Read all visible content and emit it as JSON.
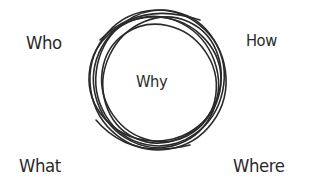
{
  "diagram": {
    "type": "five-w-one-h",
    "center": {
      "label": "Why",
      "shape": "scribbled-circle"
    },
    "corners": {
      "top_left": "Who",
      "top_right": "How",
      "bottom_left": "What",
      "bottom_right": "Where"
    },
    "colors": {
      "background": "#ffffff",
      "ink": "#2a2a2a"
    }
  }
}
